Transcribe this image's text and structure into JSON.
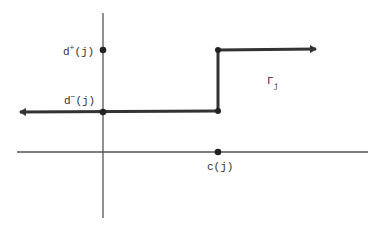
{
  "diagram": {
    "labels": {
      "d_plus": {
        "base": "d",
        "sup": "+",
        "arg": "(j)"
      },
      "d_minus": {
        "base": "d",
        "sup": "−",
        "arg": "(j)"
      },
      "c": "c(j)",
      "gamma": {
        "base": "Γ",
        "sub": "j"
      }
    },
    "colors": {
      "axis": "#555555",
      "function": "#333333",
      "text": "#333333",
      "background": "#ffffff"
    },
    "geometry": {
      "origin": [
        103,
        152
      ],
      "y_axis": {
        "x": 103,
        "y_top": 13,
        "y_bottom": 218
      },
      "x_axis": {
        "y": 152,
        "x_left": 17,
        "x_right": 368
      },
      "lower_level_y": 112,
      "upper_level_y": 50,
      "step_x": 218,
      "left_arrow_tip_x": 14,
      "right_arrow_tip_x": 322
    },
    "points": [
      {
        "name": "d_plus",
        "x": 103,
        "y": 50
      },
      {
        "name": "d_minus",
        "x": 103,
        "y": 112
      },
      {
        "name": "step_bottom",
        "x": 218,
        "y": 111
      },
      {
        "name": "step_top",
        "x": 218,
        "y": 50
      },
      {
        "name": "c",
        "x": 218,
        "y": 152
      }
    ]
  }
}
